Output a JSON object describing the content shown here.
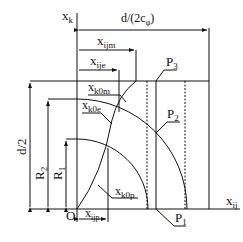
{
  "diagram": {
    "type": "geometric-construction",
    "labels": {
      "x_axis": "x",
      "x_axis_sub": "ij",
      "y_axis": "x",
      "y_axis_sub": "k",
      "origin": "O",
      "top_dim": "d/(2c",
      "top_dim_sub": "φ",
      "top_dim_close": ")",
      "x_ijm": "x",
      "x_ijm_sub": "ijm",
      "x_ije": "x",
      "x_ije_sub": "ije",
      "x_ijp": "x",
      "x_ijp_sub": "ijp",
      "x_k0m": "x",
      "x_k0m_sub": "k0m",
      "x_k0e": "x",
      "x_k0e_sub": "k0e",
      "x_k0p": "x",
      "x_k0p_sub": "k0p",
      "P1": "P",
      "P1_sub": "1",
      "P2": "P",
      "P2_sub": "2",
      "P3": "P",
      "P3_sub": "3",
      "half_d": "d/2",
      "R2": "R",
      "R2_sub": "2",
      "R1": "R",
      "R1_sub": "1"
    }
  }
}
